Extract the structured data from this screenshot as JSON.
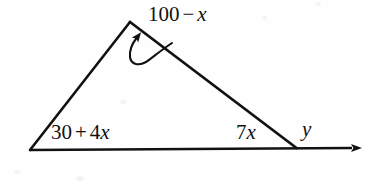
{
  "figure": {
    "kind": "geometry-diagram",
    "background_color": "#fefefe",
    "stroke_color": "#111111",
    "text_color": "#111111",
    "width": 386,
    "height": 189
  },
  "labels": {
    "apex": {
      "name": "apex-angle-label",
      "full_text": "100 - x",
      "constant": "100",
      "operator": "−",
      "variable": "x",
      "coefficient": ""
    },
    "bottom_left": {
      "name": "bottom-left-angle-label",
      "full_text": "30 + 4x",
      "constant": "30",
      "operator": "+",
      "coefficient": "4",
      "variable": "x"
    },
    "bottom_right": {
      "name": "bottom-right-angle-label",
      "full_text": "7x",
      "coefficient": "7",
      "variable": "x"
    },
    "exterior": {
      "name": "exterior-angle-label",
      "full_text": "y",
      "variable": "y"
    }
  },
  "geometry": {
    "vertices": {
      "left": {
        "x": 30,
        "y": 150
      },
      "apex": {
        "x": 130,
        "y": 22
      },
      "right": {
        "x": 296,
        "y": 148
      }
    },
    "base_ray": {
      "from": {
        "x": 30,
        "y": 150
      },
      "to": {
        "x": 362,
        "y": 148
      },
      "arrowhead": "right"
    },
    "leader_arrow": {
      "name": "apex-leader-arrow",
      "target": {
        "x": 137,
        "y": 34
      },
      "arrowhead": "up"
    }
  }
}
